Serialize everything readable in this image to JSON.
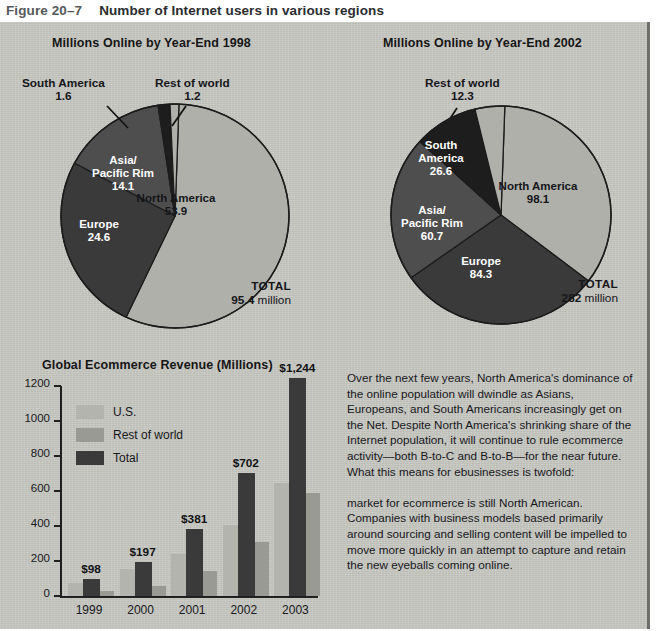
{
  "figure": {
    "number": "Figure 20–7",
    "title": "Number of Internet users in various regions"
  },
  "colors": {
    "panel_background": "#c9c9c4",
    "slice_light": "#b0b0ab",
    "slice_medium": "#8f8f8b",
    "slice_dark": "#3a3a3a",
    "slice_darkest": "#1d1d1d",
    "bar_us": "#b4b4af",
    "bar_row": "#9a9a95",
    "bar_total": "#3a3a3a",
    "outline": "#1c1c1c"
  },
  "pie_1998": {
    "title": "Millions Online by Year-End 1998",
    "total_word": "TOTAL",
    "total_value": "95.4",
    "total_unit": "million",
    "slices": [
      {
        "label": "North America",
        "value": "53.9",
        "number": 53.9,
        "fill": "light",
        "label_color": "on-light"
      },
      {
        "label": "Europe",
        "value": "24.6",
        "number": 24.6,
        "fill": "dark",
        "label_color": "on-dark"
      },
      {
        "label": "Asia/\nPacific Rim",
        "value": "14.1",
        "number": 14.1,
        "fill": "medium-dark",
        "label_color": "on-dark"
      },
      {
        "label": "South America",
        "value": "1.6",
        "number": 1.6,
        "fill": "darkest",
        "label_color": "on-light"
      },
      {
        "label": "Rest of world",
        "value": "1.2",
        "number": 1.2,
        "fill": "light",
        "label_color": "on-light"
      }
    ]
  },
  "pie_2002": {
    "title": "Millions Online by Year-End 2002",
    "total_word": "TOTAL",
    "total_value": "282",
    "total_unit": "million",
    "slices": [
      {
        "label": "North America",
        "value": "98.1",
        "number": 98.1,
        "fill": "light",
        "label_color": "on-light"
      },
      {
        "label": "Europe",
        "value": "84.3",
        "number": 84.3,
        "fill": "dark",
        "label_color": "on-dark"
      },
      {
        "label": "Asia/\nPacific Rim",
        "value": "60.7",
        "number": 60.7,
        "fill": "medium-dark",
        "label_color": "on-dark"
      },
      {
        "label": "South\nAmerica",
        "value": "26.6",
        "number": 26.6,
        "fill": "darkest",
        "label_color": "on-dark"
      },
      {
        "label": "Rest of world",
        "value": "12.3",
        "number": 12.3,
        "fill": "light",
        "label_color": "on-light"
      }
    ]
  },
  "bar_chart": {
    "title": "Global Ecommerce Revenue (Millions)",
    "legend": [
      {
        "label": "U.S.",
        "fill": "bar_us"
      },
      {
        "label": "Rest of world",
        "fill": "bar_row"
      },
      {
        "label": "Total",
        "fill": "bar_total"
      }
    ]
  },
  "chart_data": [
    {
      "type": "pie",
      "title": "Millions Online by Year-End 1998",
      "unit": "millions of people online",
      "labels": [
        "North America",
        "Europe",
        "Asia/Pacific Rim",
        "South America",
        "Rest of world"
      ],
      "values": [
        53.9,
        24.6,
        14.1,
        1.6,
        1.2
      ],
      "total": 95.4,
      "total_label": "TOTAL 95.4 million",
      "legend": "inline slice labels",
      "annotations": [
        "South America 1.6",
        "Rest of world 1.2"
      ]
    },
    {
      "type": "pie",
      "title": "Millions Online by Year-End 2002",
      "unit": "millions of people online",
      "labels": [
        "North America",
        "Europe",
        "Asia/Pacific Rim",
        "South America",
        "Rest of world"
      ],
      "values": [
        98.1,
        84.3,
        60.7,
        26.6,
        12.3
      ],
      "total": 282,
      "total_label": "TOTAL 282 million",
      "legend": "inline slice labels",
      "annotations": [
        "Rest of world 12.3"
      ]
    },
    {
      "type": "bar",
      "title": "Global Ecommerce Revenue (Millions)",
      "xlabel": "",
      "ylabel": "",
      "ylim": [
        0,
        1200
      ],
      "yticks": [
        0,
        200,
        400,
        600,
        800,
        1000,
        1200
      ],
      "grid": false,
      "legend_position": "upper-left inside plot",
      "categories": [
        "1999",
        "2000",
        "2001",
        "2002",
        "2003"
      ],
      "series": [
        {
          "name": "U.S.",
          "values": [
            72,
            155,
            240,
            405,
            645
          ]
        },
        {
          "name": "Rest of world",
          "values": [
            26,
            56,
            141,
            310,
            590
          ]
        },
        {
          "name": "Total",
          "values": [
            98,
            197,
            381,
            702,
            1244
          ]
        }
      ],
      "data_labels": [
        "$98",
        "$197",
        "$381",
        "$702",
        "$1,244"
      ]
    }
  ],
  "body_copy": {
    "paragraph_1": "Over the next few years, North America's dominance of the online population will dwindle as Asians, Europeans, and South Americans increasingly get on the Net. Despite North America's shrinking share of the Internet population, it will continue to rule ecommerce activity—both B-to-C and B-to-B—for the near future. What this means for ebusinesses is twofold:",
    "paragraph_2": "market for ecommerce is still North American. Companies with business models based primarily around sourcing and selling content will be impelled to move more quickly in an attempt to capture and retain the new eyeballs coming online."
  }
}
